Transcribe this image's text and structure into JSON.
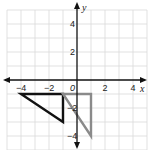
{
  "chart_data": {
    "type": "coordinate-plane",
    "title": "",
    "xlabel": "x",
    "ylabel": "y",
    "xlim": [
      -5,
      5
    ],
    "ylim": [
      -5,
      5
    ],
    "grid": true,
    "x_ticks": [
      {
        "value": -4,
        "label": "−4"
      },
      {
        "value": -2,
        "label": "−2"
      },
      {
        "value": 0,
        "label": "0"
      },
      {
        "value": 2,
        "label": "2"
      },
      {
        "value": 4,
        "label": "4"
      }
    ],
    "y_ticks": [
      {
        "value": 4,
        "label": "4"
      },
      {
        "value": 2,
        "label": "2"
      },
      {
        "value": -2,
        "label": "−2"
      },
      {
        "value": -4,
        "label": "−4"
      }
    ],
    "shapes": [
      {
        "name": "black-triangle",
        "type": "triangle",
        "vertices": [
          [
            -4,
            -1
          ],
          [
            -1,
            -1
          ],
          [
            -1,
            -3
          ]
        ],
        "stroke": "#111111"
      },
      {
        "name": "gray-triangle",
        "type": "triangle",
        "vertices": [
          [
            -1,
            -1
          ],
          [
            1,
            -1
          ],
          [
            1,
            -4
          ]
        ],
        "stroke": "#8a8a8a"
      }
    ]
  },
  "colors": {
    "grid": "#d9d9d9",
    "axis": "#111111",
    "background": "#ffffff"
  }
}
